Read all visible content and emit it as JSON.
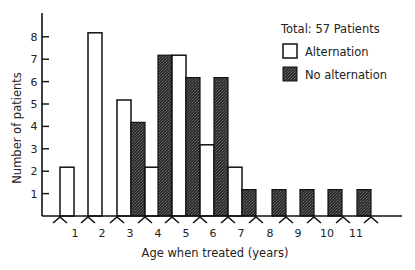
{
  "chart_data": {
    "type": "bar",
    "title": "",
    "xlabel": "Age when treated (years)",
    "ylabel": "Number of patients",
    "categories": [
      "1",
      "2",
      "3",
      "4",
      "5",
      "6",
      "7",
      "8",
      "9",
      "10",
      "11"
    ],
    "series": [
      {
        "name": "Alternation",
        "fill": "#ffffff",
        "values": [
          2,
          8,
          5,
          2,
          7,
          3,
          2,
          0,
          0,
          0,
          0
        ]
      },
      {
        "name": "No alternation",
        "fill": "#3a3a3a",
        "values": [
          0,
          0,
          4,
          7,
          6,
          6,
          1,
          1,
          1,
          1,
          1
        ]
      }
    ],
    "yticks": [
      1,
      2,
      3,
      4,
      5,
      6,
      7,
      8
    ],
    "ylim": [
      0,
      9
    ],
    "grid": false,
    "legend_position": "top-right",
    "annotation": "Total: 57 Patients"
  },
  "legend": {
    "total": "Total: 57 Patients",
    "items": [
      "Alternation",
      "No alternation"
    ]
  }
}
